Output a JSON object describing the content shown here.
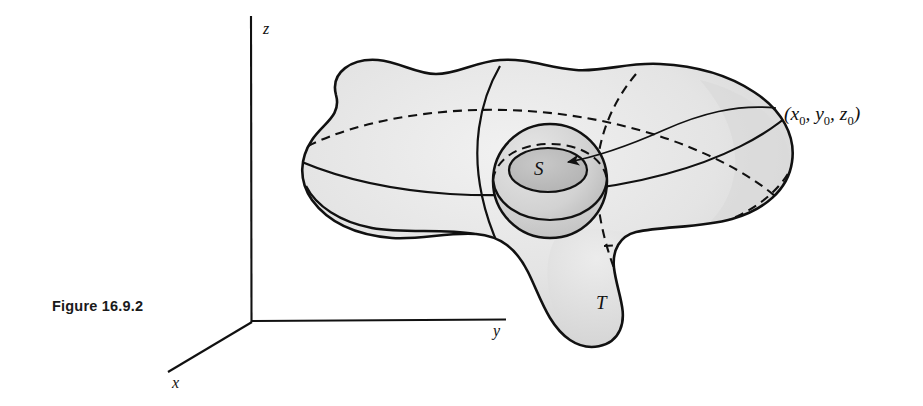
{
  "figure": {
    "caption": "Figure 16.9.2",
    "caption_pos": {
      "x": 52,
      "y": 298
    }
  },
  "axes": {
    "origin": {
      "x": 252,
      "y": 322
    },
    "z": {
      "label": "z",
      "tip": {
        "x": 251,
        "y": 16
      },
      "label_pos": {
        "x": 263,
        "y": 20
      }
    },
    "y": {
      "label": "y",
      "tip": {
        "x": 506,
        "y": 320
      },
      "label_pos": {
        "x": 493,
        "y": 322
      }
    },
    "x": {
      "label": "x",
      "tip": {
        "x": 168,
        "y": 372
      },
      "label_pos": {
        "x": 172,
        "y": 374
      }
    }
  },
  "labels": {
    "outer_surface": "T",
    "outer_surface_pos": {
      "x": 596,
      "y": 292
    },
    "inner_surface": "S",
    "inner_surface_pos": {
      "x": 534,
      "y": 168
    },
    "point": "(x0, y0, z0)",
    "point_parts": {
      "open": "(",
      "x": "x",
      "x_sub": "0",
      "sep1": ", ",
      "y": "y",
      "y_sub": "0",
      "sep2": ", ",
      "z": "z",
      "z_sub": "0",
      "close": ")"
    },
    "point_pos": {
      "x": 784,
      "y": 103
    }
  },
  "geometry": {
    "inner_sphere": {
      "cx": 550,
      "cy": 181,
      "r": 57
    },
    "inner_cap": {
      "cx": 548,
      "cy": 170,
      "rx": 39,
      "ry": 22
    },
    "arrow_tip": {
      "x": 562,
      "y": 160
    },
    "leader_from": {
      "x": 776,
      "y": 108
    },
    "leader_to": {
      "x": 566,
      "y": 163
    }
  },
  "colors": {
    "ink": "#111111",
    "surface_fill": "#e0e0e0",
    "surface_fill_light": "#ececec",
    "surface_fill_dark": "#cfcfcf",
    "inner_cap_fill": "#bdbdbd",
    "inner_sphere_fill": "#d6d6d6",
    "background": "#ffffff",
    "caption_color": "#1a1a1a"
  },
  "line_styles": {
    "visible": "solid",
    "hidden": "dashed",
    "dash_pattern": "9 6"
  }
}
